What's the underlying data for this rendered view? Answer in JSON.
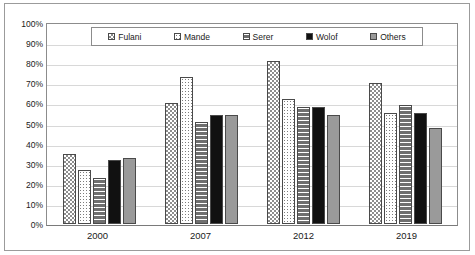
{
  "chart_data": {
    "type": "bar",
    "title": "",
    "xlabel": "",
    "ylabel": "",
    "ylim": [
      0,
      100
    ],
    "grid": true,
    "legend_position": "top-inside",
    "categories": [
      "2000",
      "2007",
      "2012",
      "2019"
    ],
    "ytick_labels": [
      "100%",
      "90%",
      "80%",
      "70%",
      "60%",
      "50%",
      "40%",
      "30%",
      "20%",
      "10%",
      "0%"
    ],
    "ytick_values": [
      100,
      90,
      80,
      70,
      60,
      50,
      40,
      30,
      20,
      10,
      0
    ],
    "series": [
      {
        "name": "Fulani",
        "pattern": "checkered",
        "values": [
          35,
          60,
          81,
          70
        ]
      },
      {
        "name": "Mande",
        "pattern": "dotted",
        "values": [
          27,
          73,
          62,
          55
        ]
      },
      {
        "name": "Serer",
        "pattern": "horizontal-lines",
        "values": [
          23,
          51,
          58,
          59
        ]
      },
      {
        "name": "Wolof",
        "pattern": "solid-black",
        "values": [
          32,
          54,
          58,
          55
        ]
      },
      {
        "name": "Others",
        "pattern": "solid-gray",
        "values": [
          33,
          54,
          54,
          48
        ]
      }
    ]
  },
  "colors": {
    "border": "#8c8c8c",
    "gridline": "#d8d8d8",
    "wolof": "#111111",
    "others": "#9a9a9a",
    "serer": "#6f6f6f"
  }
}
